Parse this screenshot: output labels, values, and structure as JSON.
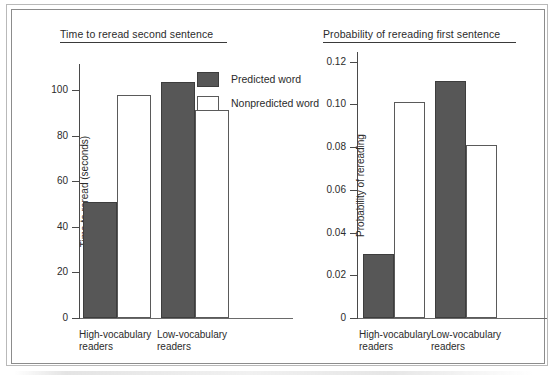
{
  "figure": {
    "legend": {
      "items": [
        {
          "label": "Predicted word",
          "swatch": "filled",
          "color": "#575757"
        },
        {
          "label": "Nonpredicted word",
          "swatch": "hollow",
          "color": "#ffffff"
        }
      ]
    }
  },
  "chart_data": [
    {
      "type": "bar",
      "panel": "left",
      "title": "Time to reread second sentence",
      "xlabel": "",
      "ylabel": "Time to reread (seconds)",
      "categories": [
        "High-vocabulary\nreaders",
        "Low-vocabulary\nreaders"
      ],
      "series": [
        {
          "name": "Predicted word",
          "values": [
            51,
            103.5
          ],
          "style": "filled"
        },
        {
          "name": "Nonpredicted word",
          "values": [
            98,
            91.5
          ],
          "style": "hollow"
        }
      ],
      "ylim": [
        0,
        112
      ],
      "yticks": [
        0,
        20,
        40,
        60,
        80,
        100
      ],
      "ytick_labels": [
        "0",
        "20",
        "40",
        "60",
        "80",
        "100"
      ],
      "grid": false,
      "legend_position": "upper-right-inside"
    },
    {
      "type": "bar",
      "panel": "right",
      "title": "Probability of rereading first sentence",
      "xlabel": "",
      "ylabel": "Probability of rereading",
      "categories": [
        "High-vocabulary\nreaders",
        "Low-vocabulary\nreaders"
      ],
      "series": [
        {
          "name": "Predicted word",
          "values": [
            0.03,
            0.111
          ],
          "style": "filled"
        },
        {
          "name": "Nonpredicted word",
          "values": [
            0.101,
            0.081
          ],
          "style": "hollow"
        }
      ],
      "ylim": [
        0,
        0.125
      ],
      "yticks": [
        0,
        0.02,
        0.04,
        0.06,
        0.08,
        0.1,
        0.12
      ],
      "ytick_labels": [
        "0",
        "0.02",
        "0.04",
        "0.06",
        "0.08",
        "0.10",
        "0.12"
      ],
      "grid": false,
      "legend_position": "none"
    }
  ]
}
